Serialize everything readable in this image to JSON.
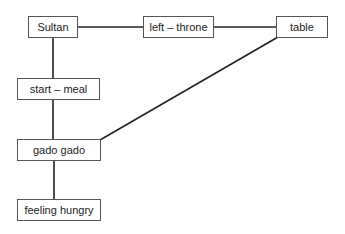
{
  "diagram": {
    "type": "concept-map",
    "nodes": [
      {
        "id": "sultan",
        "label": "Sultan",
        "x": 28,
        "y": 16,
        "w": 50,
        "h": 22
      },
      {
        "id": "left-throne",
        "label": "left – throne",
        "x": 143,
        "y": 16,
        "w": 71,
        "h": 22
      },
      {
        "id": "table",
        "label": "table",
        "x": 276,
        "y": 16,
        "w": 52,
        "h": 22
      },
      {
        "id": "start-meal",
        "label": "start – meal",
        "x": 17,
        "y": 78,
        "w": 83,
        "h": 22
      },
      {
        "id": "gado-gado",
        "label": "gado gado",
        "x": 17,
        "y": 139,
        "w": 84,
        "h": 22
      },
      {
        "id": "feeling-hungry",
        "label": "feeling hungry",
        "x": 17,
        "y": 199,
        "w": 84,
        "h": 22
      }
    ],
    "edges": [
      {
        "from": "sultan",
        "to": "left-throne",
        "x1": 78,
        "y1": 27,
        "x2": 143,
        "y2": 27
      },
      {
        "from": "left-throne",
        "to": "table",
        "x1": 214,
        "y1": 27,
        "x2": 276,
        "y2": 27
      },
      {
        "from": "sultan",
        "to": "start-meal",
        "x1": 53,
        "y1": 38,
        "x2": 53,
        "y2": 78
      },
      {
        "from": "start-meal",
        "to": "gado-gado",
        "x1": 53,
        "y1": 100,
        "x2": 53,
        "y2": 139
      },
      {
        "from": "gado-gado",
        "to": "feeling-hungry",
        "x1": 54,
        "y1": 161,
        "x2": 54,
        "y2": 199
      },
      {
        "from": "table",
        "to": "gado-gado",
        "x1": 278,
        "y1": 37,
        "x2": 100,
        "y2": 140
      }
    ]
  }
}
